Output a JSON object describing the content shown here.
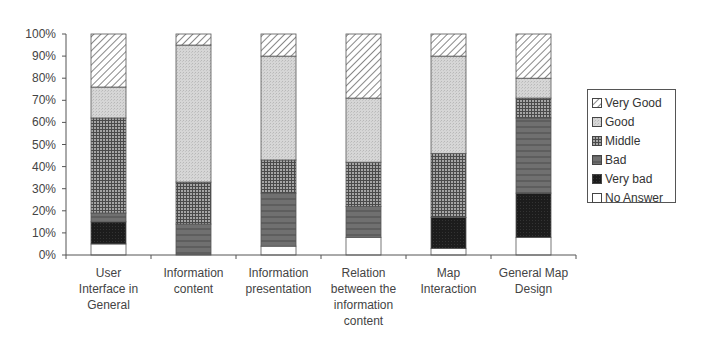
{
  "chart_data": {
    "type": "bar",
    "stacked": true,
    "percent_stacked": true,
    "title": "",
    "xlabel": "",
    "ylabel": "",
    "ylim": [
      0,
      100
    ],
    "yticks": [
      "0%",
      "10%",
      "20%",
      "30%",
      "40%",
      "50%",
      "60%",
      "70%",
      "80%",
      "90%",
      "100%"
    ],
    "grid": false,
    "legend_position": "right",
    "categories": [
      "User\nInterface in\nGeneral",
      "Information\ncontent",
      "Information\npresentation",
      "Relation\nbetween the\ninformation\ncontent",
      "Map\nInteraction",
      "General Map\nDesign"
    ],
    "series": [
      {
        "name": "No Answer",
        "values": [
          5,
          0,
          4,
          8,
          3,
          8
        ],
        "pattern": "white"
      },
      {
        "name": "Very bad",
        "values": [
          10,
          0,
          0,
          0,
          14,
          20
        ],
        "pattern": "black"
      },
      {
        "name": "Bad",
        "values": [
          4,
          14,
          24,
          14,
          0,
          34
        ],
        "pattern": "dark-gray"
      },
      {
        "name": "Middle",
        "values": [
          43,
          19,
          15,
          20,
          29,
          9
        ],
        "pattern": "grid"
      },
      {
        "name": "Good",
        "values": [
          14,
          62,
          47,
          29,
          44,
          9
        ],
        "pattern": "light-dots"
      },
      {
        "name": "Very Good",
        "values": [
          24,
          5,
          10,
          29,
          10,
          20
        ],
        "pattern": "diagonal-hatch"
      }
    ]
  },
  "legend": {
    "items": [
      {
        "label": "Very Good",
        "pattern": "diagonal-hatch"
      },
      {
        "label": "Good",
        "pattern": "light-dots"
      },
      {
        "label": "Middle",
        "pattern": "grid"
      },
      {
        "label": "Bad",
        "pattern": "dark-gray"
      },
      {
        "label": "Very bad",
        "pattern": "black"
      },
      {
        "label": "No Answer",
        "pattern": "white"
      }
    ]
  },
  "colors": {
    "axis": "#555555",
    "very_good_bg": "#ffffff",
    "very_good_line": "#777777",
    "good": "#d2d2d2",
    "middle_bg": "#9a9a9a",
    "middle_line": "#4a4a4a",
    "bad": "#6e6e6e",
    "very_bad": "#1e1e1e",
    "no_answer": "#ffffff"
  }
}
